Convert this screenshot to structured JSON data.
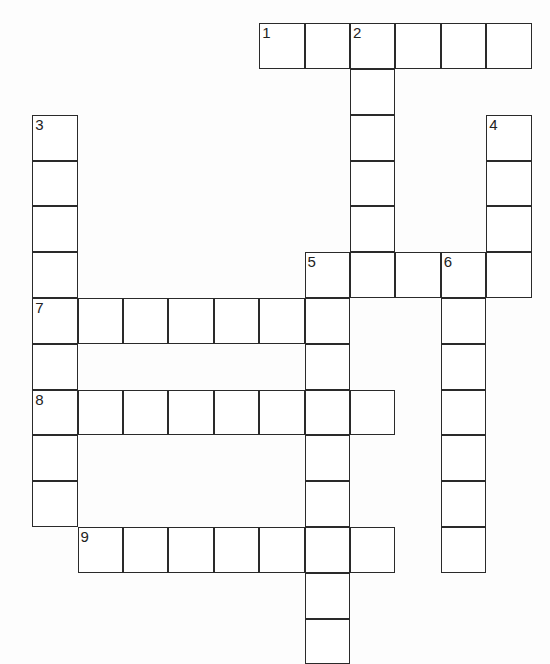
{
  "puzzle": {
    "type": "crossword",
    "cell_size": [
      45.4,
      45.8
    ],
    "origin": [
      33,
      24
    ],
    "line_color": "#2a2a2a",
    "background": "#fdfdfd",
    "words": [
      {
        "number": 1,
        "direction": "across",
        "row": 0,
        "col": 5,
        "length": 6
      },
      {
        "number": 2,
        "direction": "down",
        "row": 0,
        "col": 7,
        "length": 6
      },
      {
        "number": 3,
        "direction": "down",
        "row": 2,
        "col": 0,
        "length": 9
      },
      {
        "number": 4,
        "direction": "down",
        "row": 2,
        "col": 10,
        "length": 4
      },
      {
        "number": 5,
        "direction": "across",
        "row": 5,
        "col": 6,
        "length": 5
      },
      {
        "number": 5,
        "direction": "down",
        "row": 5,
        "col": 6,
        "length": 9
      },
      {
        "number": 6,
        "direction": "down",
        "row": 5,
        "col": 9,
        "length": 7
      },
      {
        "number": 7,
        "direction": "across",
        "row": 6,
        "col": 0,
        "length": 7
      },
      {
        "number": 8,
        "direction": "across",
        "row": 8,
        "col": 0,
        "length": 8
      },
      {
        "number": 9,
        "direction": "across",
        "row": 11,
        "col": 1,
        "length": 7
      }
    ]
  }
}
